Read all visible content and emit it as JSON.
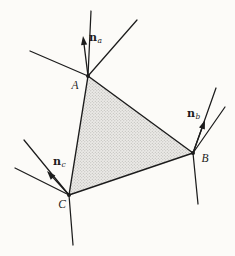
{
  "figure": {
    "kind": "geometry-diagram",
    "background_color": "#fcfbf8",
    "ink_color": "#1c1c1c",
    "shade_base_color": "#ebeae7",
    "shade_dot_color": "#b3b1ad"
  },
  "triangle": {
    "vertices": [
      {
        "id": "A",
        "label": "A",
        "x": 88,
        "y": 76
      },
      {
        "id": "B",
        "label": "B",
        "x": 193,
        "y": 153
      },
      {
        "id": "C",
        "label": "C",
        "x": 69,
        "y": 195
      }
    ]
  },
  "rays": [
    {
      "from": "A",
      "to": [
        91,
        11
      ]
    },
    {
      "from": "A",
      "to": [
        137,
        20
      ]
    },
    {
      "from": "A",
      "to": [
        30,
        51
      ]
    },
    {
      "from": "B",
      "to": [
        216,
        88
      ]
    },
    {
      "from": "B",
      "to": [
        225,
        107
      ]
    },
    {
      "from": "B",
      "to": [
        198,
        204
      ]
    },
    {
      "from": "C",
      "to": [
        24,
        140
      ]
    },
    {
      "from": "C",
      "to": [
        15,
        168
      ]
    },
    {
      "from": "C",
      "to": [
        73,
        245
      ]
    }
  ],
  "normals": [
    {
      "at": "A",
      "tip": [
        83,
        36
      ],
      "label": {
        "base": "n",
        "sub": "a"
      }
    },
    {
      "at": "B",
      "tip": [
        205,
        120
      ],
      "label": {
        "base": "n",
        "sub": "b"
      }
    },
    {
      "at": "C",
      "tip": [
        47,
        171
      ],
      "label": {
        "base": "n",
        "sub": "c"
      }
    }
  ]
}
